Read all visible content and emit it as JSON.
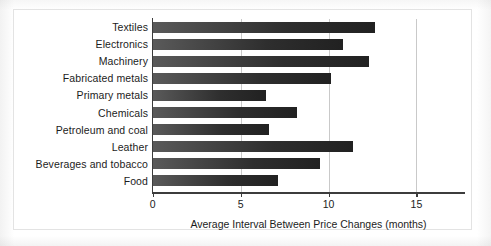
{
  "chart_data": {
    "type": "bar",
    "orientation": "horizontal",
    "title": "",
    "xlabel": "Average Interval Between Price Changes (months)",
    "ylabel": "",
    "xlim": [
      0,
      17.8
    ],
    "ylim": null,
    "grid": true,
    "gridlines_at": [
      5,
      10,
      15
    ],
    "legend": null,
    "xticks": [
      "0",
      "5",
      "10",
      "15"
    ],
    "xtick_values": [
      0,
      5,
      10,
      15
    ],
    "categories": [
      "Textiles",
      "Electronics",
      "Machinery",
      "Fabricated metals",
      "Primary metals",
      "Chemicals",
      "Petroleum and coal",
      "Leather",
      "Beverages and tobacco",
      "Food"
    ],
    "values": [
      12.6,
      10.8,
      12.3,
      10.1,
      6.4,
      8.2,
      6.6,
      11.4,
      9.5,
      7.1
    ],
    "bar_color_start": "#5a5a5a",
    "bar_color_end": "#212121"
  },
  "axis": {
    "line_color": "#3c3c3c",
    "grid_color": "#c9c9c9"
  },
  "figure": {
    "panel_background": "#ffffff",
    "page_background": "#fdfdfd",
    "panel_border_color": "#e3e3e3"
  }
}
